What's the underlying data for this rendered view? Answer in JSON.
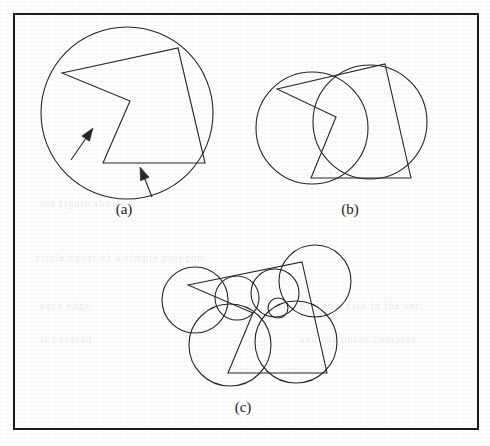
{
  "figure": {
    "frame": {
      "x": 14,
      "y": 14,
      "width": 464,
      "height": 415,
      "stroke": "#1a1a1a",
      "stroke_width": 2
    },
    "ink_color": "#262626",
    "paper_color": "#fdfdfc",
    "panels": [
      {
        "id": "a",
        "label": "(a)",
        "label_x": 124,
        "label_y": 214,
        "description": "Single large circle circumscribing a concave pentagon, with two arrows pointing at edges",
        "circles": [
          {
            "cx": 127,
            "cy": 113,
            "r": 86
          }
        ],
        "polygon": [
          [
            62,
            73
          ],
          [
            178,
            48
          ],
          [
            205,
            163
          ],
          [
            103,
            163
          ],
          [
            130,
            101
          ]
        ],
        "arrows": [
          {
            "x1": 71,
            "y1": 160,
            "x2": 93,
            "y2": 128,
            "label": "arrow-edge-left"
          },
          {
            "x1": 152,
            "y1": 197,
            "x2": 140,
            "y2": 167,
            "label": "arrow-edge-bottom"
          }
        ]
      },
      {
        "id": "b",
        "label": "(b)",
        "label_x": 350,
        "label_y": 214,
        "description": "Two overlapping circles covering the same concave pentagon",
        "circles": [
          {
            "cx": 312,
            "cy": 128,
            "r": 56
          },
          {
            "cx": 370,
            "cy": 122,
            "r": 57
          }
        ],
        "polygon": [
          [
            277,
            89
          ],
          [
            385,
            64
          ],
          [
            411,
            178
          ],
          [
            311,
            178
          ],
          [
            336,
            117
          ]
        ],
        "arrows": []
      },
      {
        "id": "c",
        "label": "(c)",
        "label_x": 243,
        "label_y": 412,
        "description": "Seven small overlapping circles covering the same concave pentagon",
        "circles": [
          {
            "cx": 195,
            "cy": 300,
            "r": 33
          },
          {
            "cx": 237,
            "cy": 298,
            "r": 22
          },
          {
            "cx": 275,
            "cy": 293,
            "r": 24
          },
          {
            "cx": 315,
            "cy": 281,
            "r": 36
          },
          {
            "cx": 230,
            "cy": 345,
            "r": 41
          },
          {
            "cx": 296,
            "cy": 342,
            "r": 41
          },
          {
            "cx": 278,
            "cy": 308,
            "r": 10
          }
        ],
        "polygon": [
          [
            188,
            285
          ],
          [
            302,
            262
          ],
          [
            327,
            373
          ],
          [
            228,
            373
          ],
          [
            253,
            313
          ]
        ],
        "arrows": []
      }
    ],
    "ghost_marks": [
      {
        "text": "the figure shows",
        "x": 40,
        "y": 198,
        "size": 10
      },
      {
        "text": "circle cover of a simple polygon",
        "x": 36,
        "y": 252,
        "size": 10
      },
      {
        "text": "each edge",
        "x": 40,
        "y": 300,
        "size": 10
      },
      {
        "text": "is covered",
        "x": 40,
        "y": 334,
        "size": 10
      },
      {
        "text": "by some disk in the set",
        "x": 300,
        "y": 300,
        "size": 10
      },
      {
        "text": "and the union contains",
        "x": 300,
        "y": 334,
        "size": 10
      }
    ]
  }
}
